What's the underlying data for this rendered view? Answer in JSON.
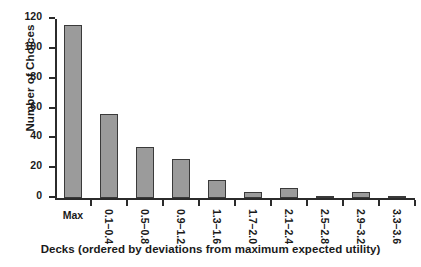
{
  "chart_data": {
    "type": "bar",
    "title": "",
    "xlabel": "Decks (ordered by deviations from maximum expected utility)",
    "ylabel": "Number of Choices",
    "categories": [
      "Max",
      "0.1–0.4",
      "0.5–0.8",
      "0.9–1.2",
      "1.3–1.6",
      "1.7–2.0",
      "2.1–2.4",
      "2.5–2.8",
      "2.9–3.2",
      "3.3–3.6"
    ],
    "values": [
      116,
      56,
      34,
      26,
      12,
      4,
      7,
      0,
      4,
      0
    ],
    "ylim": [
      0,
      120
    ],
    "yticks": [
      0,
      20,
      40,
      60,
      80,
      100,
      120
    ],
    "ytick_labels": [
      "0",
      "20",
      "40",
      "60",
      "80",
      "100",
      "120"
    ],
    "grid": false,
    "legend": false,
    "legend_position": "none",
    "bar_color": "#9b9b9b",
    "bar_edge_color": "#3a3a3a",
    "axis_color": "#2b2b2b",
    "background_color": "#ffffff"
  }
}
